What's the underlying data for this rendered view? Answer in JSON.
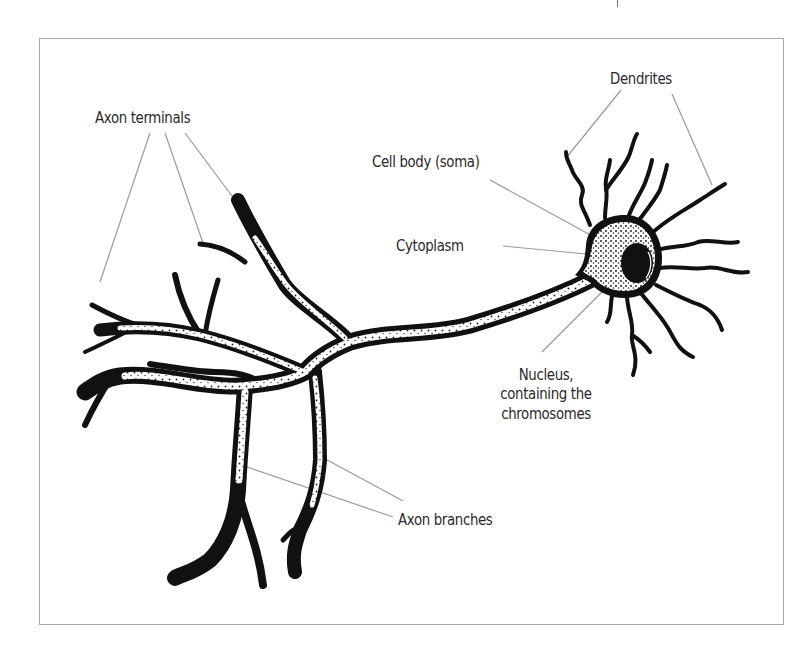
{
  "figure": {
    "labels": {
      "dendrites": "Dendrites",
      "axon_terminals": "Axon terminals",
      "cell_body": "Cell body (soma)",
      "cytoplasm": "Cytoplasm",
      "nucleus_line1": "Nucleus,",
      "nucleus_line2": "containing the",
      "nucleus_line3": "chromosomes",
      "axon_branches": "Axon branches"
    },
    "colors": {
      "frame": "#a8a8a8",
      "leader_line": "#9a9a9a",
      "ink": "#111111",
      "text": "#2a2a2a",
      "background": "#ffffff"
    }
  }
}
